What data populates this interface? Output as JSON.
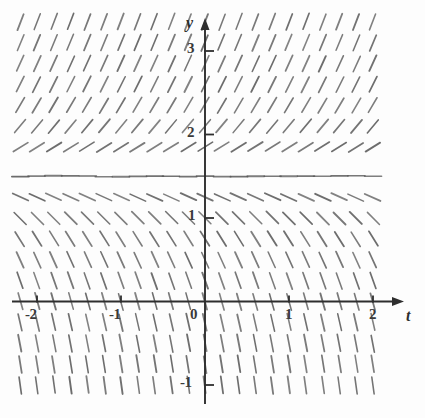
{
  "figure": {
    "title": "",
    "background_color": "#fdfdfd",
    "ink_color": "#555555",
    "axis_color": "#2e2e2e"
  },
  "axes": {
    "x_axis_label": "t",
    "y_axis_label": "y",
    "x_ticks": [
      {
        "value": -2,
        "label": "-2"
      },
      {
        "value": -1,
        "label": "-1"
      },
      {
        "value": 0,
        "label": "0"
      },
      {
        "value": 1,
        "label": "1"
      },
      {
        "value": 2,
        "label": "2"
      }
    ],
    "y_ticks": [
      {
        "value": 3,
        "label": "3"
      },
      {
        "value": 2,
        "label": "2"
      },
      {
        "value": 1,
        "label": "1"
      },
      {
        "value": -1,
        "label": "-1"
      }
    ],
    "x_axis_has_arrow": true,
    "y_axis_has_arrow": true
  },
  "chart_data": {
    "type": "scatter",
    "plot_kind": "slope-field",
    "title": "",
    "xlabel": "t",
    "ylabel": "y",
    "xlim": [
      -2.35,
      2.25
    ],
    "ylim": [
      -1.45,
      3.45
    ],
    "grid": false,
    "legend": null,
    "equilibrium_y": 1.5,
    "slope_rule": "dy/dt depends only on y; zero at y = 1.5, positive above, negative below, steepening with distance from 1.5",
    "x_tick_values": [
      -2,
      -1,
      0,
      1,
      2
    ],
    "y_tick_values": [
      3,
      2,
      1,
      -1
    ],
    "x_tick_labels": [
      "-2",
      "-1",
      "0",
      "1",
      "2"
    ],
    "y_tick_labels": [
      "3",
      "2",
      "1",
      "-1"
    ],
    "grid_x_values": [
      -2.2,
      -2.0,
      -1.8,
      -1.6,
      -1.4,
      -1.2,
      -1.0,
      -0.8,
      -0.6,
      -0.4,
      -0.2,
      0.0,
      0.2,
      0.4,
      0.6,
      0.8,
      1.0,
      1.2,
      1.4,
      1.6,
      1.8,
      2.0
    ],
    "grid_y_values": [
      3.35,
      3.1,
      2.85,
      2.6,
      2.35,
      2.1,
      1.85,
      1.6,
      1.5,
      1.25,
      1.0,
      0.75,
      0.5,
      0.25,
      0.0,
      -0.25,
      -0.5,
      -0.75,
      -1.0,
      -1.25
    ],
    "row_slopes": [
      {
        "y": 3.35,
        "slope": 2.6
      },
      {
        "y": 3.1,
        "slope": 2.4
      },
      {
        "y": 2.85,
        "slope": 2.2
      },
      {
        "y": 2.6,
        "slope": 2.0
      },
      {
        "y": 2.35,
        "slope": 1.7
      },
      {
        "y": 2.1,
        "slope": 1.2
      },
      {
        "y": 1.85,
        "slope": 0.62
      },
      {
        "y": 1.5,
        "slope": 0.0
      },
      {
        "y": 1.25,
        "slope": -0.45
      },
      {
        "y": 1.0,
        "slope": -1.0
      },
      {
        "y": 0.75,
        "slope": -1.6
      },
      {
        "y": 0.5,
        "slope": -2.2
      },
      {
        "y": 0.25,
        "slope": -2.8
      },
      {
        "y": 0.0,
        "slope": -3.6
      },
      {
        "y": -0.25,
        "slope": -4.4
      },
      {
        "y": -0.5,
        "slope": -5.2
      },
      {
        "y": -0.75,
        "slope": -6.2
      },
      {
        "y": -1.0,
        "slope": -7.2
      },
      {
        "y": -1.25,
        "slope": -8.4
      }
    ]
  }
}
